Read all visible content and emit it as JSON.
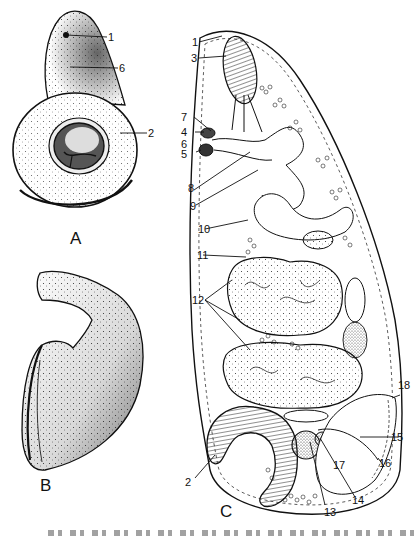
{
  "figure": {
    "panels": [
      {
        "id": "A",
        "label": "A",
        "labels": [
          "1",
          "6",
          "2"
        ]
      },
      {
        "id": "B",
        "label": "B",
        "labels": []
      },
      {
        "id": "C",
        "label": "C",
        "labels": [
          "1",
          "3",
          "7",
          "4",
          "6",
          "5",
          "8",
          "9",
          "10",
          "11",
          "12",
          "2",
          "13",
          "14",
          "15",
          "16",
          "17",
          "18"
        ]
      }
    ],
    "panel_A": {
      "letter": "A",
      "label_1": "1",
      "label_6": "6",
      "label_2": "2"
    },
    "panel_B": {
      "letter": "B"
    },
    "panel_C": {
      "letter": "C",
      "label_1": "1",
      "label_3": "3",
      "label_7": "7",
      "label_4": "4",
      "label_6": "6",
      "label_5": "5",
      "label_8": "8",
      "label_9": "9",
      "label_10": "10",
      "label_11": "11",
      "label_12": "12",
      "label_2": "2",
      "label_13": "13",
      "label_14": "14",
      "label_15": "15",
      "label_16": "16",
      "label_17": "17",
      "label_18": "18"
    },
    "caption": {
      "visible": "partially cut off at bottom edge (illegible)"
    },
    "colors": {
      "ink": "#111111",
      "paper": "#ffffff",
      "stipple": "#333333"
    }
  }
}
